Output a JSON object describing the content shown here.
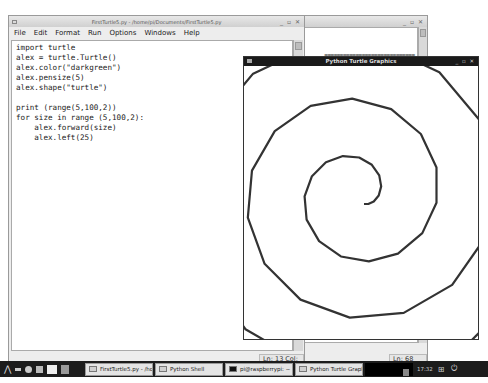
{
  "editor_window": {
    "title": "FirstTurtle5.py - /home/pi/Documents/FirstTurtle5.py",
    "controls": "_ ▫ ✕",
    "menu": [
      "File",
      "Edit",
      "Format",
      "Run",
      "Options",
      "Windows",
      "Help"
    ],
    "code_lines": [
      "import turtle",
      "alex = turtle.Turtle()",
      "alex.color(\"darkgreen\")",
      "alex.pensize(5)",
      "alex.shape(\"turtle\")",
      "",
      "print (range(5,100,2))",
      "for size in range (5,100,2):",
      "    alex.forward(size)",
      "    alex.left(25)"
    ],
    "status": "Ln: 13 Col: 0"
  },
  "shell_window": {
    "controls": "_ ▫ ✕",
    "output_line": "=============================",
    "status": "Ln: 68 Col: 4"
  },
  "turtle_window": {
    "title": "Python Turtle Graphics",
    "controls": "_ ▫ ✕",
    "drawing": {
      "start_x": 120,
      "start_y": 138,
      "size_start": 5,
      "size_stop": 100,
      "size_step": 2,
      "turn_left_deg": 25,
      "scale": 0.86,
      "pen_color": "#333333",
      "pen_width": 2.2
    }
  },
  "taskbar": {
    "items": [
      {
        "label": "FirstTurtle5.py - /home/pi...",
        "icon": "window-icon"
      },
      {
        "label": "Python Shell",
        "icon": "window-icon"
      },
      {
        "label": "pi@raspberrypi: ~",
        "icon": "terminal-icon"
      },
      {
        "label": "Python Turtle Graphics",
        "icon": "window-icon"
      }
    ],
    "clock": "17:32"
  }
}
